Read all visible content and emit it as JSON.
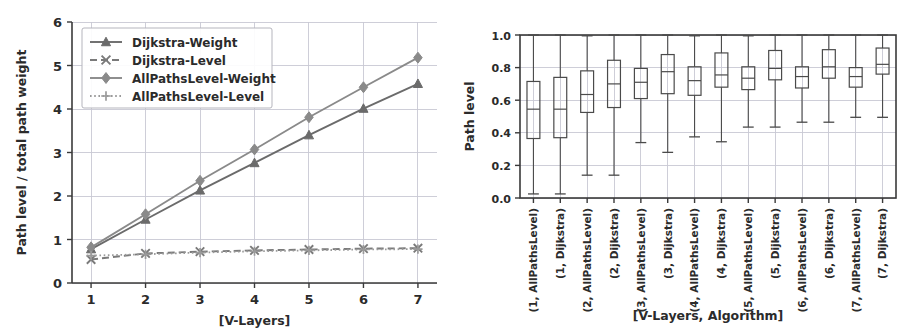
{
  "figure": {
    "panel_count": 2
  },
  "chart_data": [
    {
      "id": "left",
      "type": "line",
      "title": "",
      "xlabel": "[V-Layers]",
      "ylabel": "Path level / total path weight",
      "x": [
        1,
        2,
        3,
        4,
        5,
        6,
        7
      ],
      "xticks": [
        "1",
        "2",
        "3",
        "4",
        "5",
        "6",
        "7"
      ],
      "yticks": [
        "0",
        "1",
        "2",
        "3",
        "4",
        "5",
        "6"
      ],
      "xlim": [
        0.65,
        7.35
      ],
      "ylim": [
        0,
        6
      ],
      "grid": true,
      "legend_position": "upper left",
      "series": [
        {
          "name": "Dijkstra-Weight",
          "marker": "triangle",
          "linestyle": "solid",
          "color": "#6b6b6b",
          "values": [
            0.78,
            1.46,
            2.13,
            2.76,
            3.4,
            4.01,
            4.58
          ]
        },
        {
          "name": "Dijkstra-Level",
          "marker": "x",
          "linestyle": "dashed",
          "color": "#7a7a7a",
          "values": [
            0.54,
            0.68,
            0.72,
            0.75,
            0.77,
            0.79,
            0.8
          ]
        },
        {
          "name": "AllPathsLevel-Weight",
          "marker": "diamond",
          "linestyle": "solid",
          "color": "#8a8a8a",
          "values": [
            0.82,
            1.58,
            2.35,
            3.07,
            3.81,
            4.5,
            5.18
          ]
        },
        {
          "name": "AllPathsLevel-Level",
          "marker": "plus",
          "linestyle": "dotted",
          "color": "#9a9a9a",
          "values": [
            0.63,
            0.66,
            0.7,
            0.73,
            0.75,
            0.77,
            0.78
          ]
        }
      ]
    },
    {
      "id": "right",
      "type": "box",
      "title": "",
      "xlabel": "[V-Layers, Algorithm]",
      "ylabel": "Path level",
      "yticks": [
        "0.0",
        "0.2",
        "0.4",
        "0.6",
        "0.8",
        "1.0"
      ],
      "ylim": [
        0.0,
        1.0
      ],
      "grid": true,
      "categories": [
        "(1, AllPathsLevel)",
        "(1, Dijkstra)",
        "(2, AllPathsLevel)",
        "(2, Dijkstra)",
        "(3, AllPathsLevel)",
        "(3, Dijkstra)",
        "(4, AllPathsLevel)",
        "(4, Dijkstra)",
        "(5, AllPathsLevel)",
        "(5, Dijkstra)",
        "(6, AllPathsLevel)",
        "(6, Dijkstra)",
        "(7, AllPathsLevel)",
        "(7, Dijkstra)"
      ],
      "boxes": [
        {
          "label": "(1, AllPathsLevel)",
          "whisker_low": 0.025,
          "q1": 0.365,
          "median": 0.545,
          "q3": 0.715,
          "whisker_high": 1.0
        },
        {
          "label": "(1, Dijkstra)",
          "whisker_low": 0.025,
          "q1": 0.37,
          "median": 0.545,
          "q3": 0.74,
          "whisker_high": 1.0
        },
        {
          "label": "(2, AllPathsLevel)",
          "whisker_low": 0.14,
          "q1": 0.525,
          "median": 0.635,
          "q3": 0.78,
          "whisker_high": 0.995
        },
        {
          "label": "(2, Dijkstra)",
          "whisker_low": 0.14,
          "q1": 0.555,
          "median": 0.7,
          "q3": 0.845,
          "whisker_high": 1.0
        },
        {
          "label": "(3, AllPathsLevel)",
          "whisker_low": 0.34,
          "q1": 0.61,
          "median": 0.71,
          "q3": 0.795,
          "whisker_high": 1.0
        },
        {
          "label": "(3, Dijkstra)",
          "whisker_low": 0.28,
          "q1": 0.64,
          "median": 0.775,
          "q3": 0.88,
          "whisker_high": 1.0
        },
        {
          "label": "(4, AllPathsLevel)",
          "whisker_low": 0.375,
          "q1": 0.63,
          "median": 0.72,
          "q3": 0.805,
          "whisker_high": 0.995
        },
        {
          "label": "(4, Dijkstra)",
          "whisker_low": 0.345,
          "q1": 0.68,
          "median": 0.755,
          "q3": 0.89,
          "whisker_high": 1.0
        },
        {
          "label": "(5, AllPathsLevel)",
          "whisker_low": 0.435,
          "q1": 0.665,
          "median": 0.735,
          "q3": 0.805,
          "whisker_high": 0.995
        },
        {
          "label": "(5, Dijkstra)",
          "whisker_low": 0.435,
          "q1": 0.725,
          "median": 0.795,
          "q3": 0.905,
          "whisker_high": 1.0
        },
        {
          "label": "(6, AllPathsLevel)",
          "whisker_low": 0.465,
          "q1": 0.675,
          "median": 0.745,
          "q3": 0.805,
          "whisker_high": 1.0
        },
        {
          "label": "(6, Dijkstra)",
          "whisker_low": 0.465,
          "q1": 0.735,
          "median": 0.805,
          "q3": 0.91,
          "whisker_high": 1.0
        },
        {
          "label": "(7, AllPathsLevel)",
          "whisker_low": 0.495,
          "q1": 0.68,
          "median": 0.745,
          "q3": 0.8,
          "whisker_high": 1.0
        },
        {
          "label": "(7, Dijkstra)",
          "whisker_low": 0.495,
          "q1": 0.76,
          "median": 0.82,
          "q3": 0.92,
          "whisker_high": 1.0
        }
      ]
    }
  ]
}
